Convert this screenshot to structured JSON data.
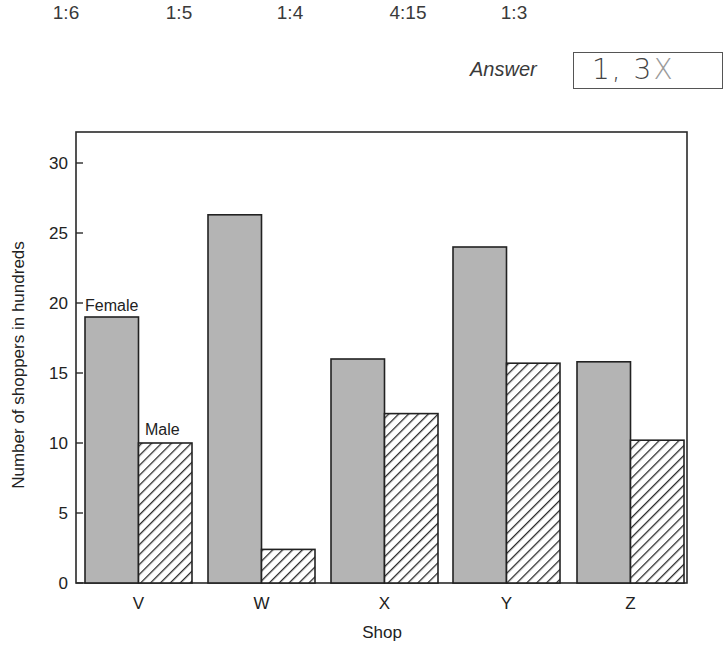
{
  "options": [
    {
      "label": "1:6",
      "x": 66
    },
    {
      "label": "1:5",
      "x": 179
    },
    {
      "label": "1:4",
      "x": 290
    },
    {
      "label": "4:15",
      "x": 408
    },
    {
      "label": "1:3",
      "x": 514
    }
  ],
  "answer": {
    "label": "Answer",
    "handwritten_main": "1, 3",
    "handwritten_faint": "X"
  },
  "colors": {
    "female_fill": "#b4b4b4",
    "male_hatch": "#2a2a2a",
    "axis": "#2a2a2a"
  },
  "chart_data": {
    "type": "bar",
    "title": "",
    "xlabel": "Shop",
    "ylabel": "Number of shoppers in hundreds",
    "categories": [
      "V",
      "W",
      "X",
      "Y",
      "Z"
    ],
    "series": [
      {
        "name": "Female",
        "style": "solid-gray",
        "values": [
          19,
          26.3,
          16,
          24,
          15.8
        ]
      },
      {
        "name": "Male",
        "style": "diagonal-hatch",
        "values": [
          10,
          2.4,
          12.1,
          15.7,
          10.2
        ]
      }
    ],
    "ylim": [
      0,
      32
    ],
    "yticks": [
      0,
      5,
      10,
      15,
      20,
      25,
      30
    ],
    "grid": false,
    "legend": "inline labels: 'Female' above first female bar, 'Male' above first male bar",
    "inline_labels": {
      "female": "Female",
      "male": "Male"
    }
  }
}
